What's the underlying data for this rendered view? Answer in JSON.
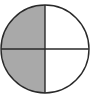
{
  "figure": {
    "total_parts": 4,
    "shaded_parts": 2,
    "shaded_fraction": "2/4",
    "center": [
      45,
      49
    ],
    "radius": 44,
    "colors": {
      "shade": "#a9a9a9",
      "outline": "#2a2a2a",
      "background": "#ffffff"
    },
    "quadrants": [
      {
        "position": "top-left",
        "shaded": true
      },
      {
        "position": "top-right",
        "shaded": false
      },
      {
        "position": "bottom-left",
        "shaded": true
      },
      {
        "position": "bottom-right",
        "shaded": false
      }
    ]
  }
}
